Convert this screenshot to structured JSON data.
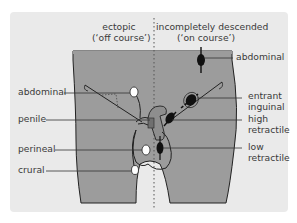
{
  "headers": {
    "ectopic_line1": "ectopic",
    "ectopic_line2": "(‘off course’)",
    "incomplete_line1": "incompletely descended",
    "incomplete_line2": "(‘on course’)"
  },
  "ectopic_labels": {
    "abdominal": "abdominal",
    "penile": "penile",
    "perineal": "perineal",
    "crural": "crural"
  },
  "incomplete_labels": {
    "abdominal": "abdominal",
    "entrant_inguinal_1": "entrant",
    "entrant_inguinal_2": "inguinal",
    "high_retractile_1": "high",
    "high_retractile_2": "retractile",
    "low_retractile_1": "low",
    "low_retractile_2": "retractile"
  },
  "colors": {
    "background": "#eaeaea",
    "body": "#9c9c9c",
    "ectopic_testis": "#ffffff",
    "incomplete_testis": "#111111",
    "line": "#333333"
  }
}
